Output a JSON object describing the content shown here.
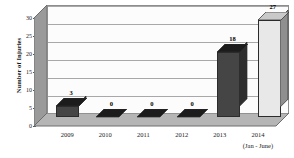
{
  "chart_data": {
    "type": "bar",
    "title": "",
    "xlabel": "",
    "ylabel": "Number of Injuries",
    "categories": [
      "2009",
      "2010",
      "2011",
      "2012",
      "2013",
      "2014"
    ],
    "category_sublabels": [
      "",
      "",
      "",
      "",
      "",
      "(Jan - June)"
    ],
    "values": [
      3,
      0,
      0,
      0,
      18,
      27
    ],
    "value_labels": [
      "3",
      "0",
      "0",
      "0",
      "18",
      "27"
    ],
    "ylim": [
      0,
      30
    ],
    "yticks": [
      0,
      5,
      10,
      15,
      20,
      25,
      30
    ],
    "ytick_labels": [
      "0",
      "5",
      "10",
      "15",
      "20",
      "25",
      "30"
    ],
    "grid": true,
    "legend": "none",
    "style": "3d-column",
    "colors": {
      "bar_dark_front": "#454545",
      "bar_dark_side": "#2e2e2e",
      "bar_dark_top": "#1c1c1c",
      "bar_light_front": "#e8e8e8",
      "bar_light_side": "#8f8f8f",
      "bar_light_top": "#c9c9c9",
      "plot_back": "#fcfcfc",
      "wall_side": "#9a9a9a",
      "floor": "#b5b5b5",
      "gridline": "#a8a8a8",
      "axis": "#6e6e6e",
      "text": "#1a1a1a"
    },
    "bar_fill_by_category": [
      "dark",
      "dark",
      "dark",
      "dark",
      "dark",
      "light"
    ]
  }
}
